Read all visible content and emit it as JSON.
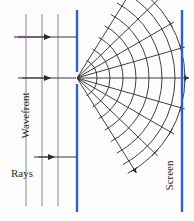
{
  "figure": {
    "background_color": "#fdfdfd",
    "labels": {
      "wavefront": "Wavefront",
      "rays": "Rays",
      "screen": "Screen"
    },
    "colors": {
      "barrier": "#2e5fd0",
      "screen": "#2e5fd0",
      "wavefront_line": "#8a8a8a",
      "ray_line": "#3b3b3b",
      "arc_line": "#2b2b2b",
      "highlight": "#b07ac0"
    }
  },
  "chart_data": {
    "type": "diagram",
    "xlabel": "",
    "ylabel": "",
    "grid": false,
    "legend_position": "none",
    "slit": {
      "x": 77,
      "y": 78,
      "gap_top": 72,
      "gap_bottom": 84
    },
    "barrier": {
      "x": 77,
      "color": "#2e5fd0",
      "segments": [
        {
          "y_start": 10,
          "y_end": 72
        },
        {
          "y_start": 84,
          "y_end": 212
        }
      ]
    },
    "screen": {
      "x": 182,
      "y_start": 10,
      "y_end": 212,
      "color": "#2e5fd0"
    },
    "plane_wavefronts": {
      "note": "vertical straight lines left of barrier",
      "x_positions": [
        26,
        42,
        58
      ],
      "y_start": 14,
      "y_end": 206,
      "color": "#8a8a8a"
    },
    "incident_rays": {
      "note": "horizontal arrows pointing right",
      "y_positions": [
        37,
        78,
        157
      ],
      "x_start": 18,
      "x_end": 77,
      "arrow_x": 48,
      "color": "#3b3b3b"
    },
    "highlight_segment": {
      "note": "short magenta segment marking one wavelength on top ray",
      "y": 37,
      "x_start": 14,
      "x_end": 30,
      "color": "#b07ac0"
    },
    "diffracted_wavefronts": {
      "note": "circular arcs centered on the slit",
      "center_x": 77,
      "center_y": 78,
      "radii": [
        20,
        33,
        46,
        59,
        72,
        85,
        98,
        108
      ],
      "angle_min_deg": -62,
      "angle_max_deg": 62,
      "color": "#2b2b2b"
    },
    "diffracted_rays": {
      "note": "radial rays from the slit to the screen",
      "center_x": 77,
      "center_y": 78,
      "angles_deg": [
        -58,
        -44,
        -30,
        -16,
        0,
        16,
        30,
        44,
        58
      ],
      "length": 112,
      "color": "#2b2b2b"
    },
    "ray_ticks": {
      "note": "short perpendicular tick marks where rays cross outer arc",
      "count": 9
    }
  }
}
